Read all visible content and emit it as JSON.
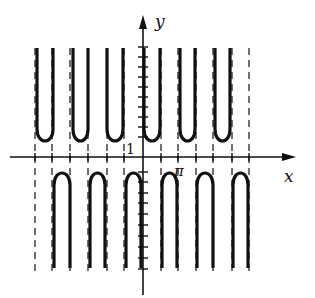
{
  "figure": {
    "axis_labels": {
      "x": "x",
      "y": "y"
    },
    "tick_labels": {
      "one": "1",
      "pi": "π"
    },
    "colors": {
      "curve": "#111111",
      "axes": "#111111",
      "asymptote": "#222222",
      "background": "#ffffff"
    }
  },
  "layout": {
    "origin_px": [
      143,
      157
    ],
    "x_axis": {
      "x_start": 10,
      "x_end": 296
    },
    "y_axis": {
      "y_start": 15,
      "y_end": 295
    },
    "x_ticks_px": [
      35,
      52,
      70,
      88,
      107,
      124,
      161,
      178,
      196,
      213,
      232,
      249
    ],
    "y_ticks_up_px": [
      47,
      57,
      67,
      77,
      87,
      97,
      107,
      117,
      127,
      137
    ],
    "y_ticks_down_px": [
      172,
      182,
      193,
      203,
      214,
      225,
      236,
      247,
      258,
      269
    ],
    "asymptotes_px": [
      35,
      52,
      70,
      88,
      107,
      124,
      161,
      178,
      196,
      213,
      232,
      249
    ],
    "upper_branches": [
      {
        "left": 36,
        "right": 54,
        "min_y": 143
      },
      {
        "left": 72,
        "right": 89,
        "min_y": 143
      },
      {
        "left": 106,
        "right": 124,
        "min_y": 143
      },
      {
        "left": 143,
        "right": 161,
        "min_y": 143
      },
      {
        "left": 179,
        "right": 196,
        "min_y": 143
      },
      {
        "left": 214,
        "right": 231,
        "min_y": 143
      }
    ],
    "lower_branches": [
      {
        "left": 53,
        "right": 71,
        "max_y": 171
      },
      {
        "left": 89,
        "right": 106,
        "max_y": 171
      },
      {
        "left": 125,
        "right": 142,
        "max_y": 171
      },
      {
        "left": 161,
        "right": 178,
        "max_y": 171
      },
      {
        "left": 196,
        "right": 214,
        "max_y": 171
      },
      {
        "left": 232,
        "right": 249,
        "max_y": 171
      }
    ],
    "branch_top_y": 48,
    "branch_bottom_y": 268
  }
}
